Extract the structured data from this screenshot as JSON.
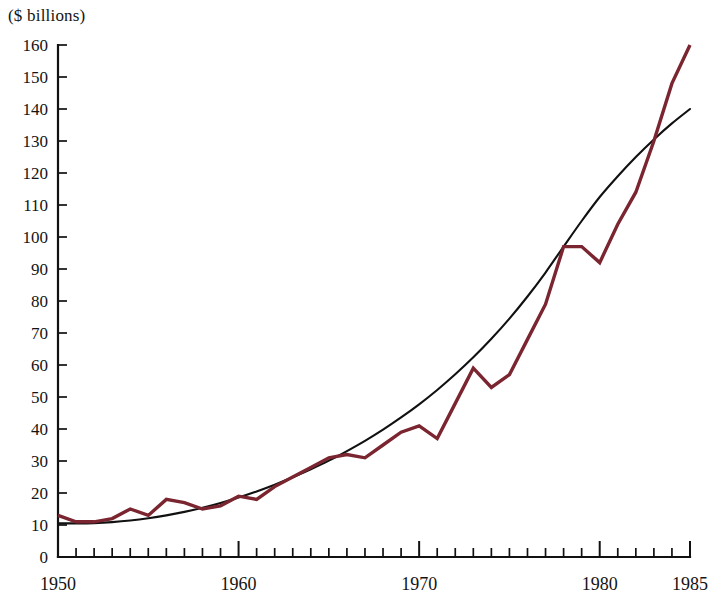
{
  "chart_data": {
    "type": "line",
    "title": "",
    "subtitle": "",
    "xlabel": "",
    "ylabel": "($ billions)",
    "unit_label": "($ billions)",
    "xlim": [
      1950,
      1985
    ],
    "ylim": [
      0,
      160
    ],
    "y_ticks": [
      0,
      10,
      20,
      30,
      40,
      50,
      60,
      70,
      80,
      90,
      100,
      110,
      120,
      130,
      140,
      150,
      160
    ],
    "y_tick_labels": [
      "0",
      "10",
      "20",
      "30",
      "40",
      "50",
      "60",
      "70",
      "80",
      "90",
      "100",
      "110",
      "120",
      "130",
      "140",
      "150",
      "160"
    ],
    "x_ticks": [
      1950,
      1951,
      1952,
      1953,
      1954,
      1955,
      1956,
      1957,
      1958,
      1959,
      1960,
      1961,
      1962,
      1963,
      1964,
      1965,
      1966,
      1967,
      1968,
      1969,
      1970,
      1971,
      1972,
      1973,
      1974,
      1975,
      1976,
      1977,
      1978,
      1979,
      1980,
      1981,
      1982,
      1983,
      1984,
      1985
    ],
    "x_tick_labels_shown": [
      "1950",
      "1960",
      "1970",
      "1980",
      "1985"
    ],
    "x_major_ticks": [
      1950,
      1960,
      1970,
      1980,
      1985
    ],
    "grid": false,
    "legend": false,
    "legend_position": "none",
    "colors": {
      "series": "#7a2530",
      "trend": "#111111",
      "axis": "#111111",
      "background": "#ffffff",
      "text": "#141414"
    },
    "x": [
      1950,
      1951,
      1952,
      1953,
      1954,
      1955,
      1956,
      1957,
      1958,
      1959,
      1960,
      1961,
      1962,
      1963,
      1964,
      1965,
      1966,
      1967,
      1968,
      1969,
      1970,
      1971,
      1972,
      1973,
      1974,
      1975,
      1976,
      1977,
      1978,
      1979,
      1980,
      1981,
      1982,
      1983,
      1984,
      1985
    ],
    "series": [
      {
        "name": "data",
        "color": "#7a2530",
        "style": "solid",
        "values": [
          13,
          11,
          11,
          12,
          15,
          13,
          18,
          17,
          15,
          16,
          19,
          18,
          22,
          25,
          28,
          31,
          32,
          31,
          35,
          39,
          41,
          37,
          48,
          59,
          53,
          57,
          68,
          79,
          97,
          97,
          92,
          104,
          114,
          130,
          148,
          160
        ]
      },
      {
        "name": "trend",
        "color": "#111111",
        "style": "smooth",
        "values": [
          10.5,
          10.5,
          10.6,
          10.9,
          11.4,
          12.1,
          13.0,
          14.1,
          15.4,
          16.9,
          18.6,
          20.5,
          22.6,
          24.9,
          27.4,
          30.1,
          33.1,
          36.3,
          39.8,
          43.6,
          47.7,
          52.2,
          57.1,
          62.4,
          68.2,
          74.5,
          81.4,
          88.9,
          97.0,
          105.0,
          112.5,
          119.0,
          125.0,
          130.5,
          135.5,
          140.0
        ]
      }
    ]
  }
}
